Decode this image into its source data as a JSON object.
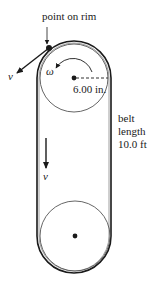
{
  "diagram": {
    "labels": {
      "point_on_rim": "point on rim",
      "v_tangent": "v",
      "omega": "ω",
      "radius": "6.00 in.",
      "belt_line1": "belt",
      "belt_line2": "length",
      "belt_line3": "10.0 ft",
      "v_belt": "v"
    },
    "colors": {
      "stroke": "#1a1a1a",
      "pulley_stroke": "#555555",
      "background": "#ffffff"
    },
    "geometry": {
      "top_pulley_center": [
        74,
        78
      ],
      "bottom_pulley_center": [
        75,
        236
      ],
      "pulley_radius": 36,
      "belt_outer_left_x": 37,
      "belt_outer_right_x": 113
    }
  }
}
